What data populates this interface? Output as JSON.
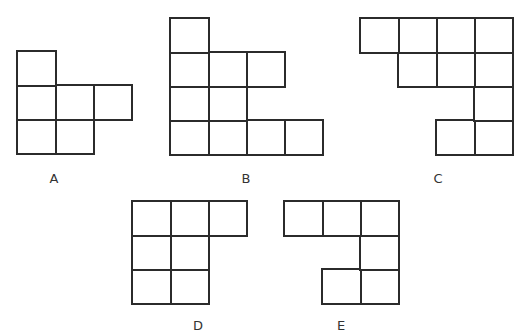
{
  "diagram": {
    "stroke_color": "#2b2b2b",
    "background": "#ffffff",
    "cell_width": 38,
    "cell_height": 34,
    "shapes": [
      {
        "id": "A",
        "label": "A",
        "label_pos": [
          54,
          178
        ],
        "origin": [
          17,
          51
        ],
        "cells": [
          [
            0,
            0
          ],
          [
            0,
            1
          ],
          [
            1,
            1
          ],
          [
            2,
            1
          ],
          [
            0,
            2
          ],
          [
            1,
            2
          ]
        ]
      },
      {
        "id": "B",
        "label": "B",
        "label_pos": [
          246,
          178
        ],
        "origin": [
          170,
          18
        ],
        "cells": [
          [
            0,
            0
          ],
          [
            0,
            1
          ],
          [
            1,
            1
          ],
          [
            2,
            1
          ],
          [
            0,
            2
          ],
          [
            1,
            2
          ],
          [
            0,
            3
          ],
          [
            1,
            3
          ],
          [
            2,
            3
          ],
          [
            3,
            3
          ]
        ]
      },
      {
        "id": "C",
        "label": "C",
        "label_pos": [
          438,
          178
        ],
        "origin": [
          360,
          18
        ],
        "cells": [
          [
            0,
            0
          ],
          [
            1,
            0
          ],
          [
            2,
            0
          ],
          [
            3,
            0
          ],
          [
            1,
            1
          ],
          [
            2,
            1
          ],
          [
            3,
            1
          ],
          [
            3,
            2
          ],
          [
            2,
            3
          ],
          [
            3,
            3
          ]
        ]
      },
      {
        "id": "D",
        "label": "D",
        "label_pos": [
          198,
          325
        ],
        "origin": [
          132,
          201
        ],
        "cells": [
          [
            0,
            0
          ],
          [
            1,
            0
          ],
          [
            2,
            0
          ],
          [
            0,
            1
          ],
          [
            1,
            1
          ],
          [
            0,
            2
          ],
          [
            1,
            2
          ]
        ]
      },
      {
        "id": "E",
        "label": "E",
        "label_pos": [
          341,
          325
        ],
        "origin": [
          284,
          201
        ],
        "cells": [
          [
            0,
            0
          ],
          [
            1,
            0
          ],
          [
            2,
            0
          ],
          [
            2,
            1
          ],
          [
            1,
            2
          ],
          [
            2,
            2
          ]
        ]
      }
    ]
  }
}
